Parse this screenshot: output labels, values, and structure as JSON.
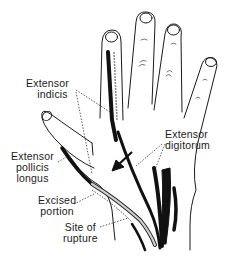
{
  "diagram": {
    "colors": {
      "ink": "#1a1a1a",
      "background": "#ffffff",
      "tendon_fill": "#111111",
      "graft_fill": "#bdbdbd"
    },
    "labels": {
      "extensor_indicis": {
        "line1": "Extensor",
        "line2": "indicis"
      },
      "extensor_digitorum": {
        "line1": "Extensor",
        "line2": "digitorum"
      },
      "extensor_pollicis_longus": {
        "line1": "Extensor",
        "line2": "pollicis",
        "line3": "longus"
      },
      "excised_portion": {
        "line1": "Excised",
        "line2": "portion"
      },
      "site_of_rupture": {
        "line1": "Site of",
        "line2": "rupture"
      }
    },
    "arrow": {
      "direction": "down-left",
      "meaning": "tendon transfer"
    }
  }
}
